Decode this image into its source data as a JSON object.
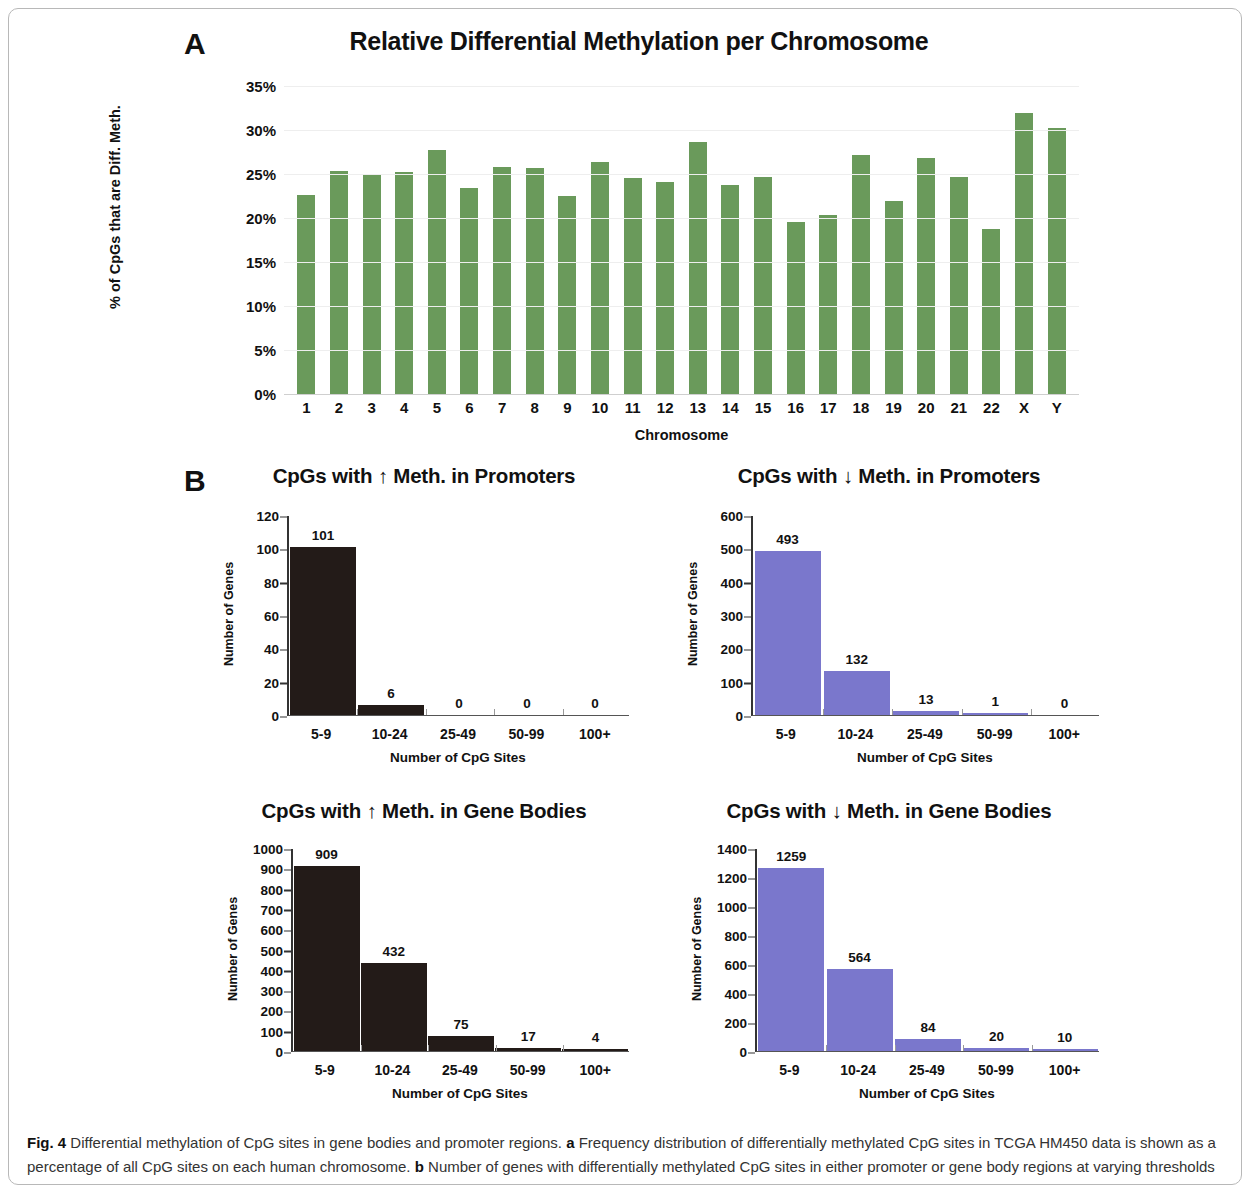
{
  "figure": {
    "caption_label": "Fig. 4",
    "caption_text_1": " Differential methylation of CpG sites in gene bodies and promoter regions. ",
    "caption_bold_a": "a",
    "caption_text_2": " Frequency distribution of differentially methylated CpG sites in TCGA HM450 data is shown as a percentage of all CpG sites on each human chromosome. ",
    "caption_bold_b": "b",
    "caption_text_3": " Number of genes with differentially methylated CpG sites in either promoter or gene body regions at varying thresholds"
  },
  "panels": {
    "a_letter": "A",
    "b_letter": "B"
  },
  "colors": {
    "green": "#6a9a5b",
    "purple": "#7a77cc",
    "black": "#231b18"
  },
  "chart_data": [
    {
      "id": "panel_a",
      "type": "bar",
      "title": "Relative Differential Methylation per Chromosome",
      "xlabel": "Chromosome",
      "ylabel": "% of CpGs that are Diff. Meth.",
      "ylim": [
        0,
        35
      ],
      "ytick_labels": [
        "0%",
        "5%",
        "10%",
        "15%",
        "20%",
        "25%",
        "30%",
        "35%"
      ],
      "ytick_values": [
        0,
        5,
        10,
        15,
        20,
        25,
        30,
        35
      ],
      "grid": true,
      "legend": "none",
      "bar_color": "#6a9a5b",
      "categories": [
        "1",
        "2",
        "3",
        "4",
        "5",
        "6",
        "7",
        "8",
        "9",
        "10",
        "11",
        "12",
        "13",
        "14",
        "15",
        "16",
        "17",
        "18",
        "19",
        "20",
        "21",
        "22",
        "X",
        "Y"
      ],
      "values": [
        22.6,
        25.3,
        24.9,
        25.2,
        27.7,
        23.4,
        25.8,
        25.7,
        22.5,
        26.4,
        24.6,
        24.1,
        28.6,
        23.7,
        24.7,
        19.5,
        20.3,
        27.2,
        21.9,
        26.8,
        24.7,
        18.7,
        31.9,
        30.2
      ]
    },
    {
      "id": "b_up_promoters",
      "type": "bar",
      "title": "CpGs with ↑ Meth. in Promoters",
      "xlabel": "Number of CpG Sites",
      "ylabel": "Number of Genes",
      "ylim": [
        0,
        120
      ],
      "ytick_labels": [
        "0",
        "20",
        "40",
        "60",
        "80",
        "100",
        "120"
      ],
      "ytick_values": [
        0,
        20,
        40,
        60,
        80,
        100,
        120
      ],
      "grid": false,
      "legend": "none",
      "bar_color": "#231b18",
      "categories": [
        "5-9",
        "10-24",
        "25-49",
        "50-99",
        "100+"
      ],
      "values": [
        101,
        6,
        0,
        0,
        0
      ],
      "value_labels": [
        "101",
        "6",
        "0",
        "0",
        "0"
      ]
    },
    {
      "id": "b_down_promoters",
      "type": "bar",
      "title": "CpGs with ↓ Meth. in Promoters",
      "xlabel": "Number of CpG Sites",
      "ylabel": "Number of Genes",
      "ylim": [
        0,
        600
      ],
      "ytick_labels": [
        "0",
        "100",
        "200",
        "300",
        "400",
        "500",
        "600"
      ],
      "ytick_values": [
        0,
        100,
        200,
        300,
        400,
        500,
        600
      ],
      "grid": false,
      "legend": "none",
      "bar_color": "#7a77cc",
      "categories": [
        "5-9",
        "10-24",
        "25-49",
        "50-99",
        "100+"
      ],
      "values": [
        493,
        132,
        13,
        1,
        0
      ],
      "value_labels": [
        "493",
        "132",
        "13",
        "1",
        "0"
      ]
    },
    {
      "id": "b_up_gene_bodies",
      "type": "bar",
      "title": "CpGs with ↑ Meth. in Gene Bodies",
      "xlabel": "Number of CpG Sites",
      "ylabel": "Number of Genes",
      "ylim": [
        0,
        1000
      ],
      "ytick_labels": [
        "0",
        "100",
        "200",
        "300",
        "400",
        "500",
        "600",
        "700",
        "800",
        "900",
        "1000"
      ],
      "ytick_values": [
        0,
        100,
        200,
        300,
        400,
        500,
        600,
        700,
        800,
        900,
        1000
      ],
      "grid": false,
      "legend": "none",
      "bar_color": "#231b18",
      "categories": [
        "5-9",
        "10-24",
        "25-49",
        "50-99",
        "100+"
      ],
      "values": [
        909,
        432,
        75,
        17,
        4
      ],
      "value_labels": [
        "909",
        "432",
        "75",
        "17",
        "4"
      ]
    },
    {
      "id": "b_down_gene_bodies",
      "type": "bar",
      "title": "CpGs with ↓ Meth. in Gene Bodies",
      "xlabel": "Number of CpG Sites",
      "ylabel": "Number of Genes",
      "ylim": [
        0,
        1400
      ],
      "ytick_labels": [
        "0",
        "200",
        "400",
        "600",
        "800",
        "1000",
        "1200",
        "1400"
      ],
      "ytick_values": [
        0,
        200,
        400,
        600,
        800,
        1000,
        1200,
        1400
      ],
      "grid": false,
      "legend": "none",
      "bar_color": "#7a77cc",
      "categories": [
        "5-9",
        "10-24",
        "25-49",
        "50-99",
        "100+"
      ],
      "values": [
        1259,
        564,
        84,
        20,
        10
      ],
      "value_labels": [
        "1259",
        "564",
        "84",
        "20",
        "10"
      ]
    }
  ]
}
